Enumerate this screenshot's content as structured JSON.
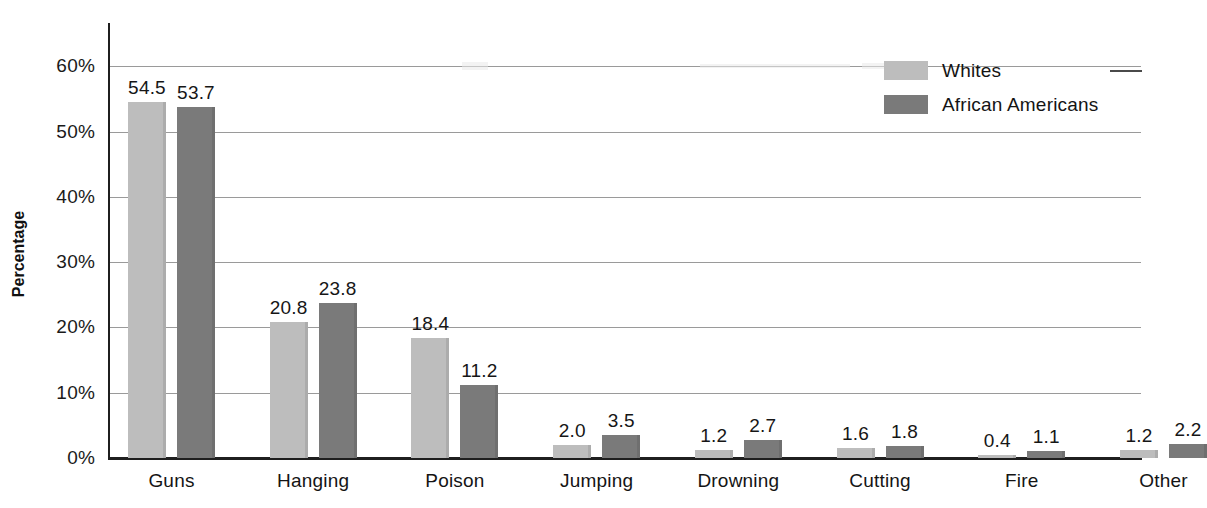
{
  "chart_data": {
    "type": "bar",
    "title": "",
    "xlabel": "",
    "ylabel": "Percentage",
    "ylim": [
      0,
      60
    ],
    "ytick_step": 10,
    "ytick_labels": [
      "0%",
      "10%",
      "20%",
      "30%",
      "40%",
      "50%",
      "60%"
    ],
    "ytick_values": [
      0,
      10,
      20,
      30,
      40,
      50,
      60
    ],
    "grid": true,
    "legend_position": "top-right",
    "categories": [
      "Guns",
      "Hanging",
      "Poison",
      "Jumping",
      "Drowning",
      "Cutting",
      "Fire",
      "Other"
    ],
    "series": [
      {
        "name": "Whites",
        "color": "#bdbdbd",
        "values": [
          54.5,
          20.8,
          18.4,
          2.0,
          1.2,
          1.6,
          0.4,
          1.2
        ],
        "labels": [
          "54.5",
          "20.8",
          "18.4",
          "2.0",
          "1.2",
          "1.6",
          "0.4",
          "1.2"
        ]
      },
      {
        "name": "African Americans",
        "color": "#7a7a7a",
        "values": [
          53.7,
          23.8,
          11.2,
          3.5,
          2.7,
          1.8,
          1.1,
          2.2
        ],
        "labels": [
          "53.7",
          "23.8",
          "11.2",
          "3.5",
          "2.7",
          "1.8",
          "1.1",
          "2.2"
        ]
      }
    ]
  },
  "legend": {
    "items": [
      {
        "label": "Whites",
        "color": "#bdbdbd"
      },
      {
        "label": "African Americans",
        "color": "#7a7a7a"
      }
    ]
  },
  "axes": {
    "y_title": "Percentage"
  }
}
